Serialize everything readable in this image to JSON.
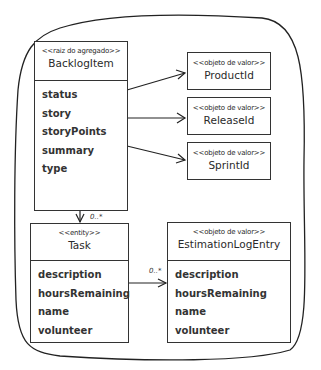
{
  "diagram": {
    "boundary": "aggregate-boundary",
    "aggregate_root": {
      "stereotype": "<<raiz do agregado>>",
      "name": "BacklogItem",
      "attributes": [
        "status",
        "story",
        "storyPoints",
        "summary",
        "type"
      ]
    },
    "value_objects": [
      {
        "stereotype": "<<objeto de valor>>",
        "name": "ProductId"
      },
      {
        "stereotype": "<<objeto de valor>>",
        "name": "ReleaseId"
      },
      {
        "stereotype": "<<objeto de valor>>",
        "name": "SprintId"
      }
    ],
    "task": {
      "stereotype": "<<entity>>",
      "name": "Task",
      "attributes": [
        "description",
        "hoursRemaining",
        "name",
        "volunteer"
      ]
    },
    "estimation": {
      "stereotype": "<<objeto de valor>>",
      "name": "EstimationLogEntry",
      "attributes": [
        "description",
        "hoursRemaining",
        "name",
        "volunteer"
      ]
    },
    "associations": [
      {
        "from": "BacklogItem",
        "to": "ProductId",
        "multiplicity": ""
      },
      {
        "from": "BacklogItem",
        "to": "ReleaseId",
        "multiplicity": ""
      },
      {
        "from": "BacklogItem",
        "to": "SprintId",
        "multiplicity": ""
      },
      {
        "from": "BacklogItem",
        "to": "Task",
        "multiplicity": "0..*"
      },
      {
        "from": "Task",
        "to": "EstimationLogEntry",
        "multiplicity": "0..*"
      }
    ]
  }
}
